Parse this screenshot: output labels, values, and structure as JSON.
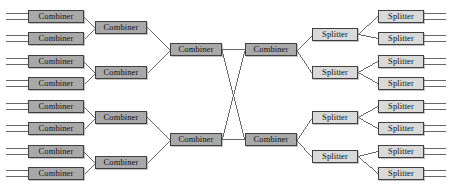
{
  "diagram": {
    "type": "network-topology",
    "width": 460,
    "height": 185,
    "background_color": "#ffffff",
    "line_color": "#555555",
    "border_color": "#404040",
    "labels": {
      "combiner": "Combiner",
      "splitter": "Splitter"
    },
    "colors": {
      "combiner_fill": "#a9a9a9",
      "splitter_fill": "#d9d9d9"
    },
    "stages": [
      {
        "id": "stage-1",
        "kind": "combiner",
        "count": 8,
        "box_width": 56,
        "box_height": 13,
        "x": 28,
        "nodes": [
          {
            "label": "Combiner",
            "y": 10
          },
          {
            "label": "Combiner",
            "y": 32
          },
          {
            "label": "Combiner",
            "y": 55
          },
          {
            "label": "Combiner",
            "y": 77
          },
          {
            "label": "Combiner",
            "y": 100
          },
          {
            "label": "Combiner",
            "y": 122
          },
          {
            "label": "Combiner",
            "y": 145
          },
          {
            "label": "Combiner",
            "y": 167
          }
        ]
      },
      {
        "id": "stage-2",
        "kind": "combiner",
        "count": 4,
        "box_width": 52,
        "box_height": 13,
        "x": 95,
        "nodes": [
          {
            "label": "Combiner",
            "y": 21
          },
          {
            "label": "Combiner",
            "y": 66
          },
          {
            "label": "Combiner",
            "y": 111
          },
          {
            "label": "Combiner",
            "y": 156
          }
        ]
      },
      {
        "id": "stage-3",
        "kind": "combiner",
        "count": 2,
        "box_width": 52,
        "box_height": 13,
        "x": 170,
        "nodes": [
          {
            "label": "Combiner",
            "y": 43
          },
          {
            "label": "Combiner",
            "y": 133
          }
        ]
      },
      {
        "id": "stage-4",
        "kind": "combiner",
        "count": 2,
        "box_width": 52,
        "box_height": 13,
        "x": 245,
        "nodes": [
          {
            "label": "Combiner",
            "y": 43
          },
          {
            "label": "Combiner",
            "y": 133
          }
        ]
      },
      {
        "id": "stage-5",
        "kind": "splitter",
        "count": 4,
        "box_width": 46,
        "box_height": 13,
        "x": 312,
        "nodes": [
          {
            "label": "Splitter",
            "y": 28
          },
          {
            "label": "Splitter",
            "y": 66
          },
          {
            "label": "Splitter",
            "y": 111
          },
          {
            "label": "Splitter",
            "y": 150
          }
        ]
      },
      {
        "id": "stage-6",
        "kind": "splitter",
        "count": 8,
        "box_width": 46,
        "box_height": 13,
        "x": 378,
        "nodes": [
          {
            "label": "Splitter",
            "y": 10
          },
          {
            "label": "Splitter",
            "y": 32
          },
          {
            "label": "Splitter",
            "y": 55
          },
          {
            "label": "Splitter",
            "y": 77
          },
          {
            "label": "Splitter",
            "y": 100
          },
          {
            "label": "Splitter",
            "y": 122
          },
          {
            "label": "Splitter",
            "y": 145
          },
          {
            "label": "Splitter",
            "y": 167
          }
        ]
      }
    ],
    "stub_length": 22,
    "stub_offset": 3,
    "edges": [
      {
        "from": "stage-1.0",
        "to": "stage-2.0"
      },
      {
        "from": "stage-1.1",
        "to": "stage-2.0"
      },
      {
        "from": "stage-1.2",
        "to": "stage-2.1"
      },
      {
        "from": "stage-1.3",
        "to": "stage-2.1"
      },
      {
        "from": "stage-1.4",
        "to": "stage-2.2"
      },
      {
        "from": "stage-1.5",
        "to": "stage-2.2"
      },
      {
        "from": "stage-1.6",
        "to": "stage-2.3"
      },
      {
        "from": "stage-1.7",
        "to": "stage-2.3"
      },
      {
        "from": "stage-2.0",
        "to": "stage-3.0"
      },
      {
        "from": "stage-2.1",
        "to": "stage-3.0"
      },
      {
        "from": "stage-2.2",
        "to": "stage-3.1"
      },
      {
        "from": "stage-2.3",
        "to": "stage-3.1"
      },
      {
        "from": "stage-3.0",
        "to": "stage-4.0"
      },
      {
        "from": "stage-3.0",
        "to": "stage-4.1"
      },
      {
        "from": "stage-3.1",
        "to": "stage-4.0"
      },
      {
        "from": "stage-3.1",
        "to": "stage-4.1"
      },
      {
        "from": "stage-4.0",
        "to": "stage-5.0"
      },
      {
        "from": "stage-4.0",
        "to": "stage-5.1"
      },
      {
        "from": "stage-4.1",
        "to": "stage-5.2"
      },
      {
        "from": "stage-4.1",
        "to": "stage-5.3"
      },
      {
        "from": "stage-5.0",
        "to": "stage-6.0"
      },
      {
        "from": "stage-5.0",
        "to": "stage-6.1"
      },
      {
        "from": "stage-5.1",
        "to": "stage-6.2"
      },
      {
        "from": "stage-5.1",
        "to": "stage-6.3"
      },
      {
        "from": "stage-5.2",
        "to": "stage-6.4"
      },
      {
        "from": "stage-5.2",
        "to": "stage-6.5"
      },
      {
        "from": "stage-5.3",
        "to": "stage-6.6"
      },
      {
        "from": "stage-5.3",
        "to": "stage-6.7"
      }
    ]
  }
}
